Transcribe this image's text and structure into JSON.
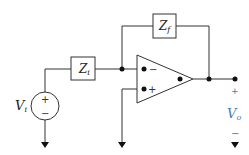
{
  "diagram": {
    "components": {
      "input_impedance": {
        "label": "Z",
        "subscript": "i"
      },
      "feedback_impedance": {
        "label": "Z",
        "subscript": "f"
      },
      "source": {
        "label": "V",
        "subscript": "i",
        "plus": "+",
        "minus": "−"
      },
      "opamp": {
        "inverting": "−",
        "noninverting": "+"
      },
      "output": {
        "label": "V",
        "subscript": "o",
        "plus": "+",
        "minus": "−"
      }
    },
    "colors": {
      "wire": "#333333",
      "output_label": "#4a7ab5"
    }
  }
}
